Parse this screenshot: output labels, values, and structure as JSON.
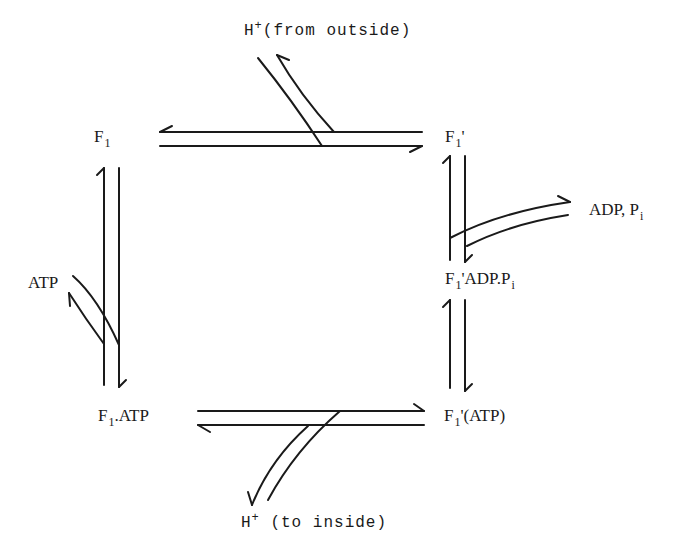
{
  "diagram": {
    "type": "reaction-cycle",
    "nodes": {
      "f1": {
        "base": "F",
        "sub": "1",
        "suffix": ""
      },
      "f1_prime": {
        "base": "F",
        "sub": "1",
        "suffix": "'"
      },
      "f1_prime_adp_pi": {
        "base": "F",
        "sub": "1",
        "suffix": "'ADP.P",
        "suffix_sub": "i"
      },
      "f1_atp": {
        "base": "F",
        "sub": "1",
        "suffix": ".ATP"
      },
      "f1_prime_atp": {
        "base": "F",
        "sub": "1",
        "suffix": "'(ATP)"
      }
    },
    "branches": {
      "h_from_outside": {
        "base": "H",
        "sup": "+",
        "text": "(from outside)"
      },
      "h_to_inside": {
        "base": "H",
        "sup": "+",
        "text": " (to inside)"
      },
      "adp_pi": {
        "text": "ADP, P",
        "sub": "i"
      },
      "atp": {
        "text": "ATP"
      }
    },
    "edges": [
      {
        "from": "F1",
        "to": "F1'",
        "reversible": true,
        "coupled": "H+ (from outside)"
      },
      {
        "from": "F1'",
        "to": "F1'ADP.Pi",
        "reversible": true,
        "coupled": "ADP, Pi"
      },
      {
        "from": "F1'ADP.Pi",
        "to": "F1'(ATP)",
        "reversible": true
      },
      {
        "from": "F1'(ATP)",
        "to": "F1.ATP",
        "reversible": true,
        "coupled": "H+ (to inside)"
      },
      {
        "from": "F1.ATP",
        "to": "F1",
        "reversible": true,
        "coupled": "ATP"
      }
    ]
  }
}
